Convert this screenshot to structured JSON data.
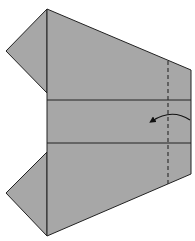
{
  "diagram": {
    "title": "Origami fold step",
    "colors": {
      "paper": "#a7a7a7",
      "line": "#222222",
      "background": "#ffffff"
    },
    "elements": {
      "body": "paper body",
      "top_flap": "upper left flap",
      "bottom_flap": "lower left flap",
      "crease_1": "horizontal crease upper",
      "crease_2": "horizontal crease lower",
      "fold_line": "valley fold (dashed)",
      "arrow": "fold direction arrow (fold right edge to the left)"
    }
  }
}
